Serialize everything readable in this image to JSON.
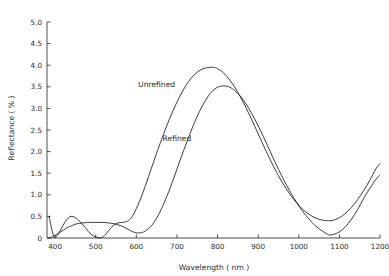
{
  "chart_data": {
    "type": "line",
    "title": "",
    "xlabel": "Wavelength ( nm )",
    "ylabel": "Reflectance ( % )",
    "xlim": [
      380,
      1200
    ],
    "ylim": [
      0,
      5.0
    ],
    "grid": false,
    "legend_position": "inline-annotation",
    "xticks": [
      400,
      500,
      600,
      700,
      800,
      900,
      1000,
      1100,
      1200
    ],
    "xticklabels": [
      "400",
      "500",
      "600",
      "700",
      "800",
      "900",
      "1000",
      "1100",
      "1200"
    ],
    "yticks": [
      0,
      0.5,
      1.0,
      1.5,
      2.0,
      2.5,
      3.0,
      3.5,
      4.0,
      4.5,
      5.0
    ],
    "yticklabels": [
      "0",
      "0.5",
      "1.0",
      "1.5",
      "2.0",
      "2.5",
      "3.0",
      "3.5",
      "4.0",
      "4.5",
      "5.0"
    ],
    "series": [
      {
        "name": "Unrefined",
        "color": "#1a1a1a",
        "peak_x": 790,
        "peak_y": 3.95,
        "min_x": 1075,
        "min_y": 0.4,
        "x": [
          385,
          390,
          395,
          400,
          405,
          412,
          420,
          428,
          436,
          442,
          450,
          458,
          466,
          474,
          482,
          490,
          498,
          505,
          511,
          518,
          525,
          532,
          540,
          548,
          556,
          564,
          572,
          580,
          590,
          600,
          615,
          630,
          645,
          660,
          675,
          690,
          705,
          720,
          735,
          750,
          765,
          780,
          790,
          800,
          815,
          830,
          845,
          860,
          875,
          890,
          905,
          920,
          935,
          950,
          965,
          980,
          995,
          1010,
          1025,
          1040,
          1055,
          1070,
          1075,
          1085,
          1100,
          1115,
          1130,
          1145,
          1160,
          1175,
          1190,
          1200
        ],
        "y": [
          0.5,
          0.28,
          0.08,
          0.01,
          0.05,
          0.16,
          0.3,
          0.42,
          0.49,
          0.5,
          0.47,
          0.41,
          0.33,
          0.24,
          0.15,
          0.08,
          0.03,
          0.01,
          0.0,
          0.03,
          0.09,
          0.17,
          0.26,
          0.32,
          0.35,
          0.36,
          0.37,
          0.4,
          0.5,
          0.68,
          1.02,
          1.42,
          1.83,
          2.23,
          2.6,
          2.94,
          3.24,
          3.5,
          3.7,
          3.84,
          3.92,
          3.95,
          3.95,
          3.92,
          3.82,
          3.66,
          3.45,
          3.2,
          2.92,
          2.62,
          2.31,
          2.0,
          1.71,
          1.44,
          1.2,
          0.99,
          0.81,
          0.66,
          0.55,
          0.47,
          0.42,
          0.4,
          0.4,
          0.41,
          0.47,
          0.57,
          0.71,
          0.89,
          1.1,
          1.34,
          1.6,
          1.72
        ]
      },
      {
        "name": "Refined",
        "color": "#1a1a1a",
        "peak_x": 815,
        "peak_y": 3.52,
        "min_x": 1075,
        "min_y": 0.07,
        "x": [
          385,
          392,
          400,
          410,
          420,
          430,
          440,
          450,
          460,
          470,
          480,
          490,
          500,
          510,
          520,
          530,
          540,
          550,
          560,
          570,
          580,
          590,
          600,
          610,
          620,
          635,
          650,
          665,
          680,
          695,
          710,
          725,
          740,
          755,
          770,
          785,
          800,
          815,
          830,
          845,
          860,
          875,
          890,
          905,
          920,
          935,
          950,
          965,
          980,
          995,
          1010,
          1025,
          1040,
          1055,
          1070,
          1075,
          1085,
          1100,
          1115,
          1130,
          1145,
          1160,
          1175,
          1190,
          1200
        ],
        "y": [
          0.0,
          0.02,
          0.06,
          0.12,
          0.18,
          0.24,
          0.28,
          0.32,
          0.34,
          0.35,
          0.36,
          0.36,
          0.36,
          0.36,
          0.36,
          0.35,
          0.34,
          0.32,
          0.29,
          0.25,
          0.2,
          0.15,
          0.12,
          0.12,
          0.15,
          0.26,
          0.46,
          0.74,
          1.08,
          1.46,
          1.86,
          2.24,
          2.6,
          2.92,
          3.18,
          3.38,
          3.49,
          3.52,
          3.49,
          3.39,
          3.24,
          3.03,
          2.78,
          2.5,
          2.2,
          1.89,
          1.59,
          1.31,
          1.05,
          0.82,
          0.61,
          0.44,
          0.29,
          0.18,
          0.09,
          0.07,
          0.08,
          0.14,
          0.26,
          0.44,
          0.66,
          0.92,
          1.15,
          1.36,
          1.46
        ]
      }
    ],
    "annotations": [
      {
        "text": "Unrefined",
        "x": 650,
        "y": 3.5
      },
      {
        "text": "Refined",
        "x": 700,
        "y": 2.24
      }
    ]
  }
}
